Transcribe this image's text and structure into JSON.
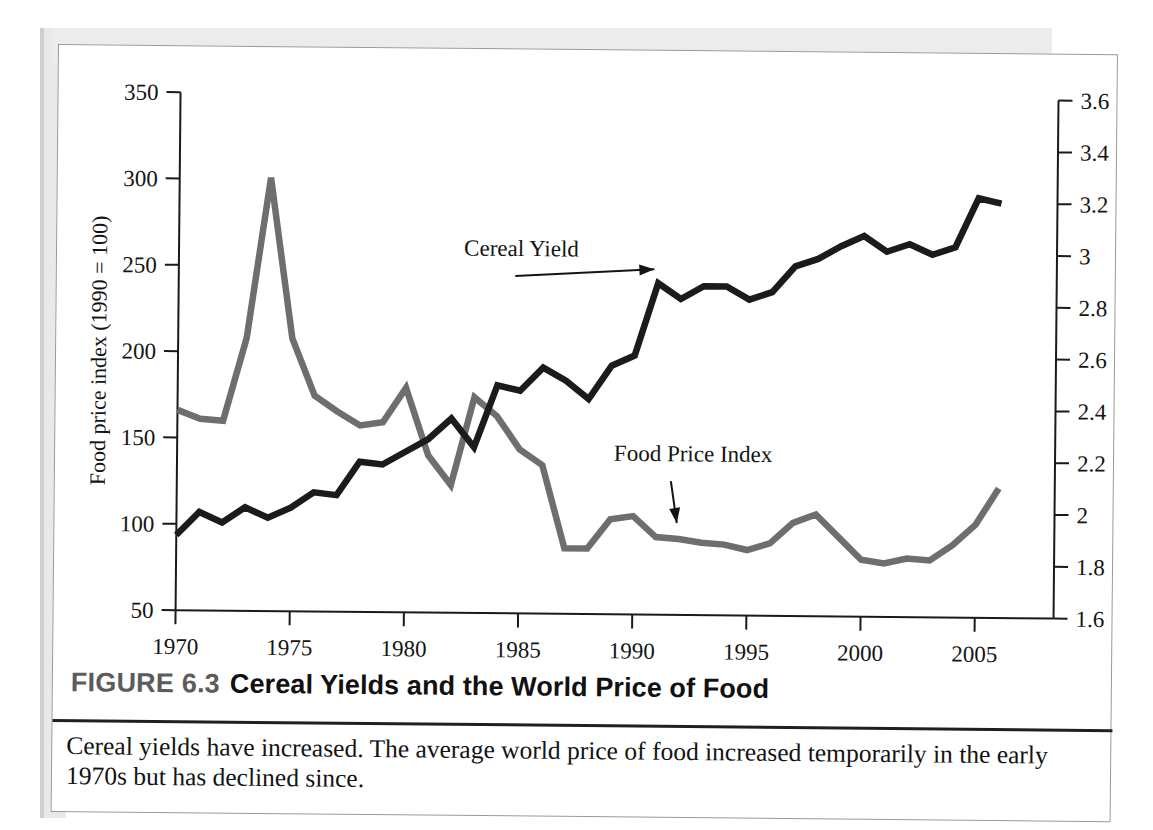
{
  "figure": {
    "label": "FIGURE 6.3",
    "title": "Cereal Yields and the World Price of Food",
    "caption": "Cereal yields have increased. The average world price of food increased temporarily in the early 1970s but has declined since."
  },
  "chart_data": {
    "type": "line",
    "title": "Cereal Yields and the World Price of Food",
    "xlabel": "",
    "ylabel": "Food price index (1990 = 100)",
    "y2label": "Cereal yields (metric tons per hectare)",
    "xlim": [
      1970,
      2006
    ],
    "ylim": [
      50,
      350
    ],
    "y2lim": [
      1.6,
      3.6
    ],
    "grid": false,
    "legend_position": "inline-annotations",
    "x_ticks": [
      "1970",
      "1975",
      "1980",
      "1985",
      "1990",
      "1995",
      "2000",
      "2005"
    ],
    "x_tick_values": [
      1970,
      1975,
      1980,
      1985,
      1990,
      1995,
      2000,
      2005
    ],
    "y_ticks": [
      "50",
      "100",
      "150",
      "200",
      "250",
      "300",
      "350"
    ],
    "y_tick_values": [
      50,
      100,
      150,
      200,
      250,
      300,
      350
    ],
    "y2_ticks": [
      "1.6",
      "1.8",
      "2",
      "2.2",
      "2.4",
      "2.6",
      "2.8",
      "3",
      "3.2",
      "3.4",
      "3.6"
    ],
    "y2_tick_values": [
      1.6,
      1.8,
      2.0,
      2.2,
      2.4,
      2.6,
      2.8,
      3.0,
      3.2,
      3.4,
      3.6
    ],
    "x": [
      1970,
      1971,
      1972,
      1973,
      1974,
      1975,
      1976,
      1977,
      1978,
      1979,
      1980,
      1981,
      1982,
      1983,
      1984,
      1985,
      1986,
      1987,
      1988,
      1989,
      1990,
      1991,
      1992,
      1993,
      1994,
      1995,
      1996,
      1997,
      1998,
      1999,
      2000,
      2001,
      2002,
      2003,
      2004,
      2005,
      2006
    ],
    "series": [
      {
        "name": "Food Price Index",
        "axis": "left",
        "color": "#6e6e6e",
        "units": "index, 1990 = 100",
        "values": [
          166,
          161,
          160,
          208,
          301,
          208,
          175,
          166,
          158,
          160,
          180,
          141,
          124,
          175,
          164,
          145,
          136,
          88,
          88,
          105,
          107,
          95,
          94,
          92,
          91,
          88,
          92,
          104,
          109,
          96,
          83,
          81,
          84,
          83,
          92,
          104,
          125
        ]
      },
      {
        "name": "Cereal Yield",
        "axis": "right",
        "color": "#1b1b1b",
        "units": "metric tons per hectare",
        "values": [
          1.89,
          1.98,
          1.94,
          2.0,
          1.96,
          2.0,
          2.06,
          2.05,
          2.18,
          2.17,
          2.22,
          2.27,
          2.35,
          2.24,
          2.48,
          2.46,
          2.55,
          2.5,
          2.43,
          2.56,
          2.6,
          2.88,
          2.82,
          2.87,
          2.87,
          2.82,
          2.85,
          2.95,
          2.98,
          3.03,
          3.07,
          3.01,
          3.04,
          3.0,
          3.03,
          3.22,
          3.2
        ]
      }
    ],
    "annotations": [
      {
        "name": "Cereal Yield",
        "text": "Cereal Yield",
        "points_to_year": 1991
      },
      {
        "name": "Food Price Index",
        "text": "Food Price Index",
        "points_to_year": 1992
      }
    ]
  }
}
